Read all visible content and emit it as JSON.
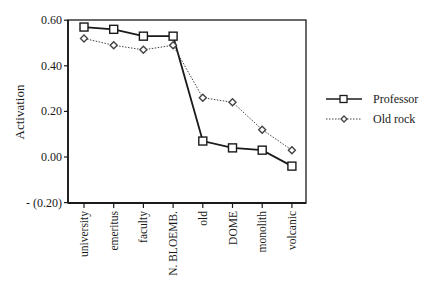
{
  "chart_data": {
    "type": "line",
    "title": "",
    "xlabel": "",
    "ylabel": "Activation",
    "ylim": [
      -0.2,
      0.6
    ],
    "yticks": [
      0.6,
      0.4,
      0.2,
      0.0,
      -0.2
    ],
    "ytick_labels": [
      "0.60",
      "0.40",
      "0.20",
      "0.00",
      "- (0.20)"
    ],
    "categories": [
      "university",
      "emeritus",
      "faculty",
      "N. BLOEMB.",
      "old",
      "DOME",
      "monolith",
      "volcanic"
    ],
    "series": [
      {
        "name": "Professor",
        "marker": "square",
        "line": "solid",
        "values": [
          0.57,
          0.56,
          0.53,
          0.53,
          0.07,
          0.04,
          0.03,
          -0.04
        ]
      },
      {
        "name": "Old rock",
        "marker": "diamond",
        "line": "dotted",
        "values": [
          0.52,
          0.49,
          0.47,
          0.49,
          0.26,
          0.24,
          0.12,
          0.03
        ]
      }
    ],
    "grid": false,
    "legend_position": "right"
  },
  "colors": {
    "axis": "#1a1a1a",
    "professor": "#1a1a1a",
    "old_rock": "#444444"
  }
}
